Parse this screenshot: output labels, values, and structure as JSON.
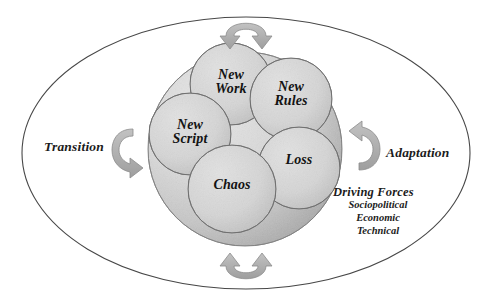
{
  "diagram": {
    "outer_shape": "ellipse",
    "left_label": "Transition",
    "right_label": "Adaptation",
    "driving_forces": {
      "heading": "Driving Forces",
      "items": [
        "Sociopolitical",
        "Economic",
        "Technical"
      ]
    },
    "core_circle": {
      "name": "change-core",
      "nodes": [
        {
          "id": "new-work",
          "line1": "New",
          "line2": "Work"
        },
        {
          "id": "new-rules",
          "line1": "New",
          "line2": "Rules"
        },
        {
          "id": "new-script",
          "line1": "New",
          "line2": "Script"
        },
        {
          "id": "chaos",
          "line1": "Chaos",
          "line2": ""
        },
        {
          "id": "loss",
          "line1": "Loss",
          "line2": ""
        }
      ]
    },
    "arrows": [
      {
        "id": "arrow-top",
        "position": "top",
        "style": "double-headed-arc-downward"
      },
      {
        "id": "arrow-bottom",
        "position": "bottom",
        "style": "double-headed-arc-upward"
      },
      {
        "id": "arrow-left",
        "position": "left",
        "style": "curved-c-arrow"
      },
      {
        "id": "arrow-right",
        "position": "right",
        "style": "curved-reverse-c-arrow"
      }
    ],
    "colors": {
      "outline": "#4a4a4a",
      "core_fill_light": "#dcdcdc",
      "core_fill_dark": "#a8a8a8",
      "node_fill": "#d6d6d6",
      "node_stroke": "#767676",
      "arrow_fill": "#b0b0b0",
      "arrow_stroke": "#8a8a8a",
      "text": "#1b1b1b",
      "background": "#ffffff"
    }
  }
}
